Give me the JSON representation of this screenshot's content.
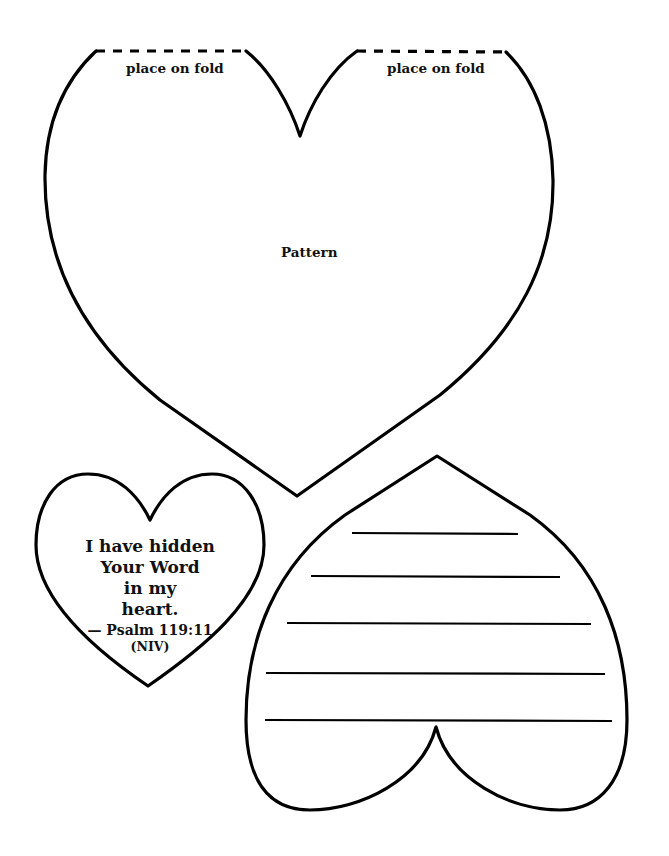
{
  "pattern_heart": {
    "fold_label_left": "place on fold",
    "fold_label_right": "place on fold",
    "center_label": "Pattern"
  },
  "verse_heart": {
    "lines": [
      "I have hidden",
      "Your Word",
      "in my",
      "heart."
    ],
    "reference": "— Psalm 119:11",
    "version": "(NIV)"
  },
  "writing_heart": {
    "line_count": 5
  },
  "colors": {
    "stroke": "#000000",
    "background": "#ffffff"
  }
}
